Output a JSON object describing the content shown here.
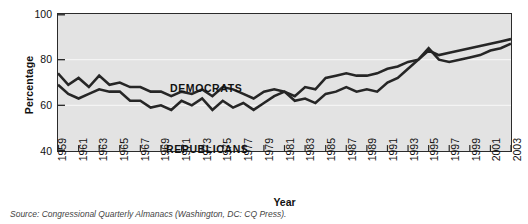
{
  "chart_data": {
    "type": "line",
    "title": "",
    "xlabel": "Year",
    "ylabel": "Percentage",
    "xlim": [
      1959,
      2003
    ],
    "ylim": [
      40,
      100
    ],
    "yticks": [
      100,
      80,
      60,
      40
    ],
    "xticks": [
      "1959",
      "1961",
      "1963",
      "1965",
      "1967",
      "1969",
      "1971",
      "1973",
      "1975",
      "1977",
      "1979",
      "1981",
      "1983",
      "1985",
      "1987",
      "1989",
      "1991",
      "1993",
      "1995",
      "1997",
      "1999",
      "2001",
      "2003"
    ],
    "grid": "horizontal-light",
    "legend_position": "inline-annotation",
    "background": "#e3e3e3",
    "line_color": "#262626",
    "x": [
      1959,
      1960,
      1961,
      1962,
      1963,
      1964,
      1965,
      1966,
      1967,
      1968,
      1969,
      1970,
      1971,
      1972,
      1973,
      1974,
      1975,
      1976,
      1977,
      1978,
      1979,
      1980,
      1981,
      1982,
      1983,
      1984,
      1985,
      1986,
      1987,
      1988,
      1989,
      1990,
      1991,
      1992,
      1993,
      1994,
      1995,
      1996,
      1997,
      1998,
      1999,
      2000,
      2001,
      2002,
      2003
    ],
    "series": [
      {
        "name": "DEMOCRATS",
        "values": [
          74,
          69,
          72,
          68,
          73,
          69,
          70,
          68,
          68,
          66,
          66,
          64,
          66,
          65,
          67,
          64,
          68,
          67,
          65,
          63,
          66,
          67,
          66,
          64,
          68,
          67,
          72,
          73,
          74,
          73,
          73,
          74,
          76,
          77,
          79,
          80,
          84,
          82,
          83,
          84,
          85,
          86,
          87,
          88,
          89
        ]
      },
      {
        "name": "REPUBLICANS",
        "values": [
          69,
          65,
          63,
          65,
          67,
          66,
          66,
          62,
          62,
          59,
          60,
          58,
          62,
          60,
          63,
          58,
          62,
          59,
          61,
          58,
          61,
          64,
          66,
          62,
          63,
          61,
          65,
          66,
          68,
          66,
          67,
          66,
          70,
          72,
          76,
          80,
          85,
          80,
          79,
          80,
          81,
          82,
          84,
          85,
          87
        ]
      }
    ],
    "annotations": [
      {
        "text": "DEMOCRATS"
      },
      {
        "text": "REPUBLICANS"
      }
    ],
    "source_note": "Source: Congressional Quarterly Almanacs (Washington, DC: CQ Press)."
  }
}
